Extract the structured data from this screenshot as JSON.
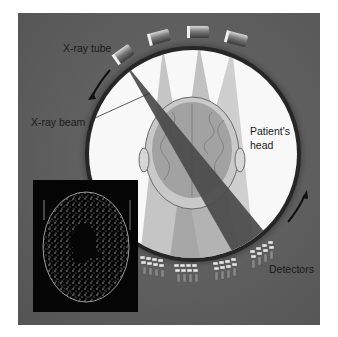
{
  "diagram": {
    "labels": {
      "xray_tube": "X-ray tube",
      "xray_beam": "X-ray beam",
      "patient_head_line1": "Patient's",
      "patient_head_line2": "head",
      "detectors": "Detectors"
    },
    "colors": {
      "background": "#ffffff",
      "panel": "#5c5c5c",
      "gantry_ring": "#2e2e2e",
      "bore": "#f7f7f7",
      "beam_main": "#4a4a4a",
      "beam_light": "#8a8a8a",
      "brain": "#9a9a9a",
      "ct_inset": "#050505"
    },
    "components": [
      "x-ray tubes (4 positions)",
      "x-ray beams",
      "patient's head",
      "detector arrays",
      "rotation arrows",
      "CT scan inset"
    ]
  }
}
